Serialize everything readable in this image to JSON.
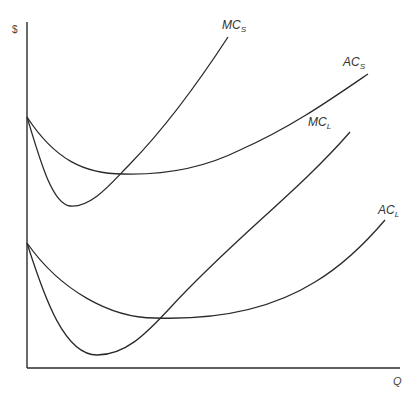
{
  "diagram": {
    "type": "cost-curves",
    "axes": {
      "y_label": "$",
      "x_label": "Q"
    },
    "curves": [
      {
        "id": "mc_s",
        "label_main": "MC",
        "label_sub": "S",
        "description": "short-run marginal cost"
      },
      {
        "id": "ac_s",
        "label_main": "AC",
        "label_sub": "S",
        "description": "short-run average cost"
      },
      {
        "id": "mc_l",
        "label_main": "MC",
        "label_sub": "L",
        "description": "long-run marginal cost"
      },
      {
        "id": "ac_l",
        "label_main": "AC",
        "label_sub": "L",
        "description": "long-run average cost"
      }
    ],
    "colors": {
      "line": "#2a2a2a",
      "background": "#ffffff"
    }
  }
}
